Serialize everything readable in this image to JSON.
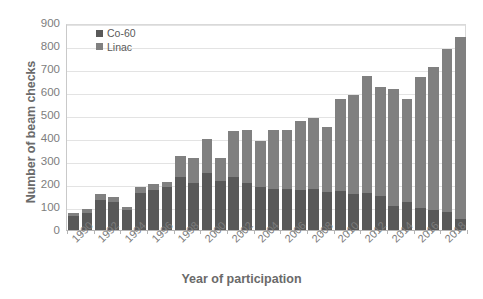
{
  "chart_data": {
    "type": "bar",
    "stacked": true,
    "title": "",
    "xlabel": "Year of participation",
    "ylabel": "Number of beam checks",
    "ylim": [
      0,
      900
    ],
    "ytick_step": 100,
    "yticks": [
      "900",
      "800",
      "700",
      "600",
      "500",
      "400",
      "300",
      "200",
      "100",
      "0"
    ],
    "grid": true,
    "legend_position": "top-left inside",
    "categories": [
      "1990",
      "1991",
      "1992",
      "1993",
      "1994",
      "1995",
      "1996",
      "1997",
      "1998",
      "1999",
      "2000",
      "2001",
      "2002",
      "2003",
      "2004",
      "2005",
      "2006",
      "2007",
      "2008",
      "2009",
      "2010",
      "2011",
      "2012",
      "2013",
      "2014",
      "2015",
      "2016",
      "2017",
      "2018",
      "2019"
    ],
    "tick_labels": [
      "1990",
      "",
      "1992",
      "",
      "1994",
      "",
      "1996",
      "",
      "1998",
      "",
      "2000",
      "",
      "2002",
      "",
      "2004",
      "",
      "2006",
      "",
      "2008",
      "",
      "2010",
      "",
      "2012",
      "",
      "2014",
      "",
      "2016",
      "",
      "2018",
      ""
    ],
    "series": [
      {
        "name": "Co-60",
        "color": "#595959",
        "values": [
          60,
          75,
          130,
          120,
          85,
          160,
          175,
          185,
          230,
          205,
          250,
          215,
          230,
          205,
          185,
          180,
          180,
          175,
          180,
          165,
          170,
          155,
          160,
          150,
          105,
          120,
          95,
          85,
          80,
          50
        ]
      },
      {
        "name": "Linac",
        "color": "#808080",
        "values": [
          15,
          15,
          25,
          25,
          15,
          25,
          25,
          25,
          90,
          110,
          145,
          100,
          200,
          230,
          200,
          255,
          255,
          300,
          305,
          285,
          400,
          430,
          510,
          470,
          510,
          450,
          570,
          625,
          705,
          790
        ]
      }
    ],
    "totals": [
      75,
      90,
      155,
      145,
      100,
      185,
      200,
      210,
      320,
      315,
      395,
      315,
      430,
      435,
      385,
      435,
      435,
      475,
      485,
      450,
      570,
      585,
      670,
      620,
      615,
      570,
      665,
      710,
      785,
      840
    ]
  },
  "legend": {
    "items": [
      {
        "label": "Co-60",
        "color": "#595959"
      },
      {
        "label": "Linac",
        "color": "#808080"
      }
    ]
  }
}
